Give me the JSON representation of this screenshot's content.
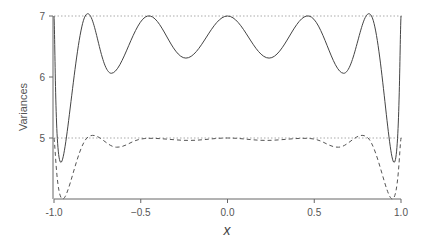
{
  "chart_data": {
    "type": "line",
    "title": "",
    "xlabel": "x",
    "ylabel": "Variances",
    "xlim": [
      -1.0,
      1.0
    ],
    "ylim": [
      4.0,
      7.0
    ],
    "grid": false,
    "legend": null,
    "x_ticks": [
      "-1.0",
      "−0.5",
      "0.0",
      "0.5",
      "1.0"
    ],
    "x_tick_values": [
      -1.0,
      -0.5,
      0.0,
      0.5,
      1.0
    ],
    "y_ticks": [
      "5",
      "6",
      "7"
    ],
    "y_tick_values": [
      5,
      6,
      7
    ],
    "reference_lines": [
      {
        "y": 7,
        "style": "dotted",
        "color": "#aaaaaa"
      },
      {
        "y": 5,
        "style": "dotted",
        "color": "#aaaaaa"
      }
    ],
    "series": [
      {
        "name": "solid",
        "style": "solid",
        "color": "#444444",
        "x": [
          -1.0,
          -0.96,
          -0.82,
          -0.67,
          -0.46,
          -0.24,
          0.0,
          0.24,
          0.47,
          0.67,
          0.83,
          0.96,
          1.0
        ],
        "y": [
          7.0,
          4.6,
          7.0,
          6.06,
          7.0,
          6.31,
          7.0,
          6.31,
          7.0,
          6.06,
          7.0,
          4.6,
          7.0
        ]
      },
      {
        "name": "dashed",
        "style": "dashed",
        "color": "#555555",
        "x": [
          -1.0,
          -0.95,
          -0.81,
          -0.64,
          -0.48,
          -0.22,
          0.0,
          0.22,
          0.48,
          0.64,
          0.81,
          0.95,
          1.0
        ],
        "y": [
          5.0,
          4.0,
          5.0,
          4.85,
          4.99,
          4.96,
          5.0,
          4.96,
          4.99,
          4.85,
          5.0,
          4.0,
          5.0
        ]
      }
    ]
  }
}
